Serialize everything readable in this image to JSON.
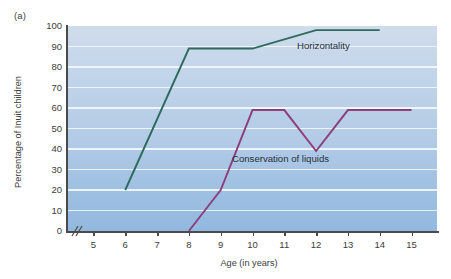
{
  "panel": {
    "label": "(a)"
  },
  "chart_data": {
    "type": "line",
    "title": "",
    "subtitle": "",
    "xlabel": "Age (in years)",
    "ylabel": "Percentage of Inuit children",
    "xlim": [
      4.2,
      15.8
    ],
    "ylim": [
      0,
      100
    ],
    "xticks": [
      5,
      6,
      7,
      8,
      9,
      10,
      11,
      12,
      13,
      14,
      15
    ],
    "xtick_labels": [
      "5",
      "6",
      "7",
      "8",
      "9",
      "10",
      "11",
      "12",
      "13",
      "14",
      "15"
    ],
    "yticks": [
      0,
      10,
      20,
      30,
      40,
      50,
      60,
      70,
      80,
      90,
      100
    ],
    "ytick_labels": [
      "0",
      "10",
      "20",
      "30",
      "40",
      "50",
      "60",
      "70",
      "80",
      "90",
      "100"
    ],
    "grid": true,
    "grid_orientation": "horizontal",
    "grid_color": "#f2f7fc",
    "axis_break": "x",
    "legend_position": "inline-annotations",
    "plot_background": "blue-gradient",
    "series": [
      {
        "name": "Horizontality",
        "color": "#2e6b5e",
        "x": [
          6,
          8,
          10,
          12,
          14
        ],
        "values": [
          20,
          89,
          89,
          98,
          98
        ],
        "label_text": "Horizontality"
      },
      {
        "name": "Conservation of liquids",
        "color": "#8c3f7a",
        "x": [
          8,
          9,
          10,
          11,
          12,
          13,
          15
        ],
        "values": [
          0,
          20,
          59,
          59,
          39,
          59,
          59
        ],
        "label_text": "Conservation of liquids"
      }
    ]
  },
  "colors": {
    "horizontality": "#2e6b5e",
    "conservation": "#8c3f7a",
    "axis": "#4a4a4a",
    "gridline": "#f2f7fc",
    "plot_bg_top": "#cfdceb",
    "plot_bg_bottom": "#93b8df"
  }
}
